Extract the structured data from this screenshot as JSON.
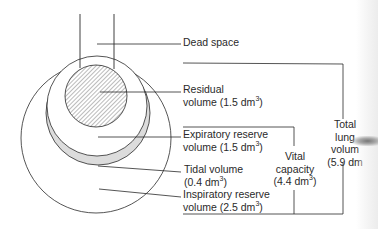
{
  "diagram": {
    "labels": {
      "dead_space": "Dead space",
      "residual_1": "Residual",
      "residual_2": "volume (1.5 dm",
      "expiratory_1": "Expiratory reserve",
      "expiratory_2": "volume (1.5 dm",
      "tidal_1": "Tidal volume",
      "tidal_2": "(0.4 dm",
      "inspiratory_1": "Inspiratory reserve",
      "inspiratory_2": "volume (2.5 dm",
      "vital_1": "Vital",
      "vital_2": "capacity",
      "vital_3": "(4.4 dm",
      "total_1": "Total",
      "total_2": "lung",
      "total_3": "volum",
      "total_4": "(5.9 dm",
      "unit_sup": "3",
      "close_paren": ")"
    },
    "volumes": [
      {
        "name": "Dead space",
        "value": null,
        "unit": "dm3"
      },
      {
        "name": "Residual volume",
        "value": 1.5,
        "unit": "dm3"
      },
      {
        "name": "Expiratory reserve volume",
        "value": 1.5,
        "unit": "dm3"
      },
      {
        "name": "Tidal volume",
        "value": 0.4,
        "unit": "dm3"
      },
      {
        "name": "Inspiratory reserve volume",
        "value": 2.5,
        "unit": "dm3"
      },
      {
        "name": "Vital capacity",
        "value": 4.4,
        "unit": "dm3"
      },
      {
        "name": "Total lung volume",
        "value": 5.9,
        "unit": "dm3"
      }
    ],
    "colors": {
      "line": "#2a2a2a",
      "tidal_fill": "#dcdcdc",
      "hatch": "#555555",
      "background": "#ffffff"
    }
  }
}
